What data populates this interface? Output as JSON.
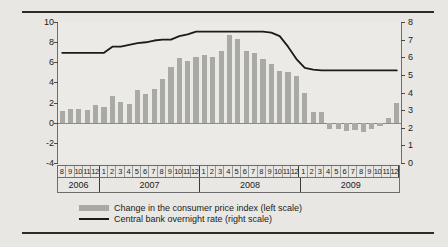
{
  "chart_data": {
    "type": "bar",
    "title": "",
    "subtitle": "",
    "xlabel": "",
    "ylabel": "",
    "y2label": "",
    "ylim": [
      -4,
      10
    ],
    "y2lim": [
      0,
      8
    ],
    "yticks": [
      10,
      8,
      6,
      4,
      2,
      0,
      -2,
      -4
    ],
    "y2ticks": [
      8,
      7,
      6,
      5,
      4,
      3,
      2,
      1,
      0
    ],
    "grid": false,
    "legend_position": "bottom",
    "x": [
      "2006-08",
      "2006-09",
      "2006-10",
      "2006-11",
      "2006-12",
      "2007-01",
      "2007-02",
      "2007-03",
      "2007-04",
      "2007-05",
      "2007-06",
      "2007-07",
      "2007-08",
      "2007-09",
      "2007-10",
      "2007-11",
      "2007-12",
      "2008-01",
      "2008-02",
      "2008-03",
      "2008-04",
      "2008-05",
      "2008-06",
      "2008-07",
      "2008-08",
      "2008-09",
      "2008-10",
      "2008-11",
      "2008-12",
      "2009-01",
      "2009-02",
      "2009-03",
      "2009-04",
      "2009-05",
      "2009-06",
      "2009-07",
      "2009-08",
      "2009-09",
      "2009-10",
      "2009-11",
      "2009-12"
    ],
    "month_labels": [
      "8",
      "9",
      "10",
      "11",
      "12",
      "1",
      "2",
      "3",
      "4",
      "5",
      "6",
      "7",
      "8",
      "9",
      "10",
      "11",
      "12",
      "1",
      "2",
      "3",
      "4",
      "5",
      "6",
      "7",
      "8",
      "9",
      "10",
      "11",
      "12",
      "1",
      "2",
      "3",
      "4",
      "5",
      "6",
      "7",
      "8",
      "9",
      "10",
      "11",
      "12"
    ],
    "year_labels": [
      "2006",
      "2007",
      "2008",
      "2009"
    ],
    "year_spans": [
      5,
      12,
      12,
      12
    ],
    "series": [
      {
        "name": "Change in the consumer price index (left scale)",
        "type": "bar",
        "axis": "left",
        "color": "#a9a9a5",
        "values": [
          1.2,
          1.4,
          1.4,
          1.3,
          1.8,
          1.6,
          2.7,
          2.1,
          1.9,
          3.2,
          2.9,
          3.3,
          4.3,
          5.5,
          6.4,
          6.1,
          6.5,
          6.7,
          6.5,
          7.1,
          8.7,
          8.3,
          7.1,
          6.9,
          6.3,
          5.8,
          5.1,
          5.0,
          4.6,
          3.0,
          1.1,
          1.1,
          -0.6,
          -0.6,
          -0.8,
          -0.7,
          -0.9,
          -0.6,
          -0.3,
          0.5,
          2.0
        ]
      },
      {
        "name": "Central bank overnight rate (right scale)",
        "type": "line",
        "axis": "right",
        "color": "#1b1b1b",
        "values": [
          6.25,
          6.25,
          6.25,
          6.25,
          6.25,
          6.25,
          6.6,
          6.6,
          6.7,
          6.8,
          6.85,
          6.95,
          7.0,
          7.0,
          7.2,
          7.3,
          7.45,
          7.45,
          7.45,
          7.45,
          7.45,
          7.45,
          7.45,
          7.45,
          7.45,
          7.4,
          7.2,
          6.6,
          5.9,
          5.4,
          5.3,
          5.25,
          5.25,
          5.25,
          5.25,
          5.25,
          5.25,
          5.25,
          5.25,
          5.25,
          5.25
        ]
      }
    ]
  },
  "legend": {
    "items": [
      {
        "label": "Change in the consumer price index (left scale)",
        "marker": "bar-swatch"
      },
      {
        "label": "Central bank overnight rate (right scale)",
        "marker": "line-swatch"
      }
    ]
  }
}
